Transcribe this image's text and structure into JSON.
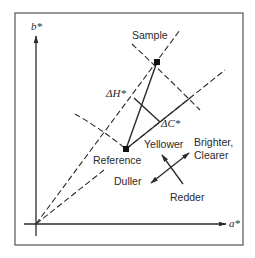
{
  "diagram": {
    "axes": {
      "x_label": "a*",
      "y_label": "b*"
    },
    "points": {
      "sample": {
        "label": "Sample"
      },
      "reference": {
        "label": "Reference"
      }
    },
    "differences": {
      "delta_h": "ΔH*",
      "delta_c": "ΔC*"
    },
    "directions": {
      "yellower": "Yellower",
      "brighter_line1": "Brighter,",
      "brighter_line2": "Clearer",
      "duller": "Duller",
      "redder": "Redder"
    },
    "colors": {
      "ink": "#2a2a2a",
      "border": "#555555",
      "background": "#ffffff"
    }
  }
}
